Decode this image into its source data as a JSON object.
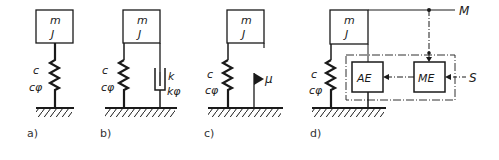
{
  "panels": [
    {
      "id": "a",
      "caption": "a)",
      "mass_labels": [
        "m",
        "J"
      ],
      "spring_labels": [
        "c",
        "cφ"
      ]
    },
    {
      "id": "b",
      "caption": "b)",
      "mass_labels": [
        "m",
        "J"
      ],
      "spring_labels": [
        "c",
        "cφ"
      ],
      "damper_labels": [
        "k",
        "kφ"
      ]
    },
    {
      "id": "c",
      "caption": "c)",
      "mass_labels": [
        "m",
        "J"
      ],
      "spring_labels": [
        "c",
        "cφ"
      ],
      "friction_label": "μ"
    },
    {
      "id": "d",
      "caption": "d)",
      "mass_labels": [
        "m",
        "J"
      ],
      "spring_labels": [
        "c",
        "cφ"
      ],
      "blocks": [
        "AE",
        "ME"
      ],
      "output_label": "M",
      "input_label": "S"
    }
  ],
  "colors": {
    "stroke": "#1a1a1a",
    "background": "#ffffff"
  }
}
